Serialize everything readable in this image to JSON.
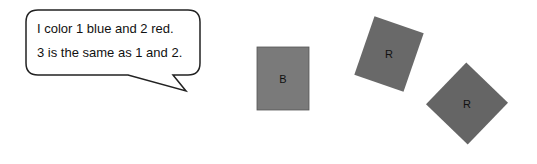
{
  "speech_bubble": {
    "lines": [
      "I color 1 blue and 2 red.",
      "3 is the same as 1 and 2."
    ]
  },
  "shapes": [
    {
      "id": "1",
      "label": "B",
      "fill": "#7a7a7a",
      "rotation_deg": 0
    },
    {
      "id": "2",
      "label": "R",
      "fill": "#696969",
      "rotation_deg": 19
    },
    {
      "id": "3",
      "label": "R",
      "fill": "#656565",
      "rotation_deg": 44
    }
  ],
  "colors": {
    "background": "#ffffff",
    "outline": "#222222"
  }
}
